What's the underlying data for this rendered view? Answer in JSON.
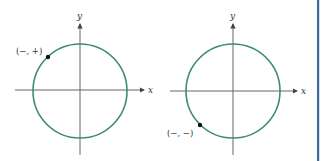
{
  "colors": {
    "circle": "#3f8a76",
    "axis": "#555555",
    "point": "#111111",
    "border": "#3c6a98"
  },
  "diagrams": [
    {
      "x_label": "x",
      "y_label": "y",
      "point_label": "(−, +)",
      "quadrant": "II"
    },
    {
      "x_label": "x",
      "y_label": "y",
      "point_label": "(−, −)",
      "quadrant": "III"
    }
  ]
}
